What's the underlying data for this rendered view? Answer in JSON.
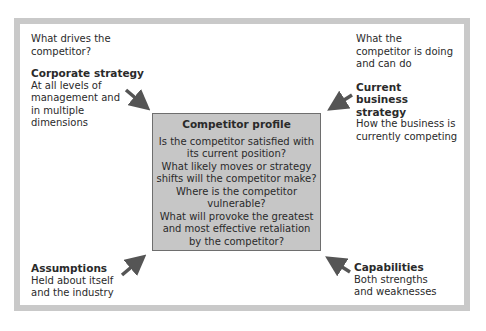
{
  "diagram": {
    "top_left": {
      "intro": "What drives the competitor?",
      "title": "Corporate strategy",
      "desc": "At all levels of management and in multiple dimensions"
    },
    "top_right": {
      "intro": "What the competitor is doing and can do",
      "title": "Current business strategy",
      "desc": "How the business is currently competing"
    },
    "bottom_left": {
      "title": "Assumptions",
      "desc": "Held about itself and the industry"
    },
    "bottom_right": {
      "title": "Capabilities",
      "desc": "Both strengths and weaknesses"
    },
    "center": {
      "title": "Competitor profile",
      "questions": [
        "Is the competitor satisfied with its current position?",
        "What likely moves or strategy shifts will the competitor make?",
        "Where is the competitor vulnerable?",
        "What will provoke the greatest and most effective retaliation by the competitor?"
      ]
    },
    "colors": {
      "frame": "#c9c9c9",
      "center_fill": "#c6c6c6",
      "arrow": "#555555"
    }
  }
}
